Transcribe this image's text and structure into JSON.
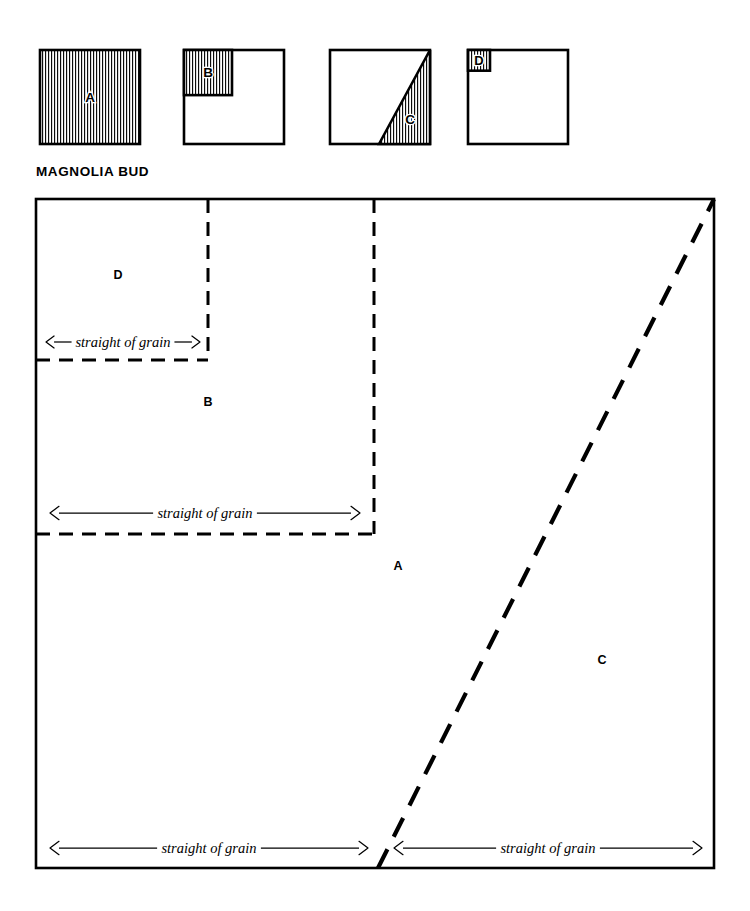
{
  "title": "MAGNOLIA BUD",
  "legend": {
    "name": "pattern-piece-key",
    "swatches": [
      {
        "id": "key-a",
        "letter": "A",
        "shape": "full-square",
        "description": "entire square hatched",
        "x": 40,
        "y": 50,
        "w": 100,
        "h": 94
      },
      {
        "id": "key-b",
        "letter": "B",
        "shape": "corner-square",
        "description": "upper left square hatched",
        "x": 184,
        "y": 50,
        "w": 100,
        "h": 94,
        "inset_w_pct": 48,
        "inset_h_pct": 48
      },
      {
        "id": "key-c",
        "letter": "C",
        "shape": "half-triangle",
        "description": "lower right triangle hatched",
        "x": 330,
        "y": 50,
        "w": 100,
        "h": 94
      },
      {
        "id": "key-d",
        "letter": "D",
        "shape": "corner-square",
        "description": "small upper left square hatched",
        "x": 468,
        "y": 50,
        "w": 100,
        "h": 94,
        "inset_w_pct": 22,
        "inset_h_pct": 22
      }
    ]
  },
  "diagram": {
    "name": "cutting-layout",
    "outer": {
      "x": 36,
      "y": 199,
      "w": 678,
      "h": 669
    },
    "pieces": [
      {
        "id": "piece-d",
        "letter": "D",
        "label_x": 118,
        "label_y": 279
      },
      {
        "id": "piece-b",
        "letter": "B",
        "label_x": 208,
        "label_y": 406
      },
      {
        "id": "piece-a",
        "letter": "A",
        "label_x": 398,
        "label_y": 570
      },
      {
        "id": "piece-c",
        "letter": "C",
        "label_x": 602,
        "label_y": 664
      }
    ],
    "grain_label": "straight of grain",
    "grain_arrows": [
      {
        "id": "grain-d",
        "piece": "D",
        "x1": 46,
        "x2": 200,
        "y": 342,
        "fontsize": 13
      },
      {
        "id": "grain-b",
        "piece": "B",
        "x1": 50,
        "x2": 360,
        "y": 513,
        "fontsize": 14.5
      },
      {
        "id": "grain-a",
        "piece": "A",
        "x1": 50,
        "x2": 368,
        "y": 848,
        "fontsize": 14.5
      },
      {
        "id": "grain-c",
        "piece": "C",
        "x1": 394,
        "x2": 702,
        "y": 848,
        "fontsize": 14.5
      }
    ],
    "cut_lines": [
      {
        "id": "cut-d-vertical",
        "x1": 208,
        "y1": 199,
        "x2": 208,
        "y2": 360
      },
      {
        "id": "cut-d-horizontal",
        "x1": 36,
        "y1": 360,
        "x2": 208,
        "y2": 360
      },
      {
        "id": "cut-b-vertical",
        "x1": 374,
        "y1": 199,
        "x2": 374,
        "y2": 534
      },
      {
        "id": "cut-b-horizontal",
        "x1": 36,
        "y1": 534,
        "x2": 374,
        "y2": 534
      },
      {
        "id": "cut-c-diagonal",
        "x1": 378,
        "y1": 868,
        "x2": 714,
        "y2": 199
      }
    ]
  },
  "colors": {
    "ink": "#000000",
    "paper": "#ffffff"
  }
}
